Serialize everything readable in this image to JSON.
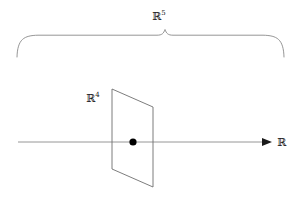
{
  "figure": {
    "title_label": "R^5 ambient space with R^4 hyperplane and R line",
    "background_color": "#ffffff",
    "stroke_color": "#808080",
    "text_color": "#1a1a1a",
    "dot_color": "#000000"
  },
  "labels": {
    "ambient": {
      "base": "ℝ",
      "exponent": "5"
    },
    "plane": {
      "base": "ℝ",
      "exponent": "4"
    },
    "axis": {
      "base": "ℝ",
      "exponent": ""
    }
  },
  "geometry": {
    "brace": {
      "left_x": 17,
      "right_x": 284,
      "arm_y": 35,
      "peak_x": 165,
      "peak_y": 29,
      "end_y": 57
    },
    "axis_line": {
      "x1": 18,
      "y1": 142,
      "x2": 272,
      "y2": 142
    },
    "arrowhead": {
      "tip_x": 272,
      "y": 142,
      "size": 6
    },
    "parallelogram": {
      "top_left": [
        112,
        89
      ],
      "top_right": [
        153,
        107
      ],
      "bottom_right": [
        153,
        187
      ],
      "bottom_left": [
        112,
        169
      ]
    },
    "point": {
      "x": 133,
      "y": 142,
      "radius": 3.6
    }
  }
}
